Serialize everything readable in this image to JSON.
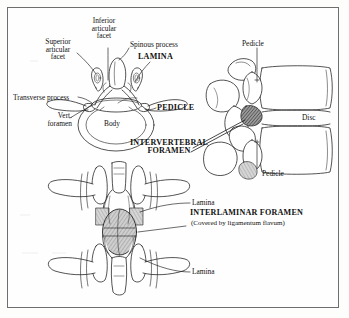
{
  "figure": {
    "domain_kind": "anatomical-illustration",
    "background_color": "#fdfdfc",
    "ink_color": "#111111",
    "border_color": "#6e6e6e"
  },
  "views": {
    "superior": {
      "name": "Superior (axial) view of lumbar vertebra",
      "labels": {
        "superior_articular_facet": "Superior\narticular\nfacet",
        "inferior_articular_facet": "Inferior\narticular\nfacet",
        "spinous_process": "Spinous process",
        "lamina": "LAMINA",
        "transverse_process": "Transverse process",
        "vert_foramen": "Vert.\nforamen",
        "body": "Body",
        "pedicle": "PEDICLE",
        "intervertebral_foramen": "INTERVERTEBRAL\nFORAMEN"
      }
    },
    "lateral": {
      "name": "Lateral view of two lumbar vertebrae",
      "labels": {
        "pedicle_top": "Pedicle",
        "disc": "Disc",
        "pedicle_bottom": "Pedicle"
      }
    },
    "posterior": {
      "name": "Posterior view of two lumbar vertebrae",
      "labels": {
        "lamina_upper": "Lamina",
        "lamina_lower": "Lamina",
        "interlaminar_foramen": "INTERLAMINAR FORAMEN",
        "interlaminar_foramen_note": "(Covered by ligamentum flavum)"
      }
    }
  }
}
